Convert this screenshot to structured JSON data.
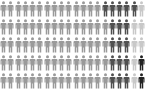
{
  "chart_data": {
    "type": "pictogram",
    "title": "",
    "grid": {
      "columns": 20,
      "rows": 5,
      "total_units": 100
    },
    "icon": "person-icon",
    "categories": [
      "gray",
      "dark",
      "light",
      "black"
    ],
    "colors": {
      "gray": "#9a9a9a",
      "dark": "#505050",
      "light": "#c8c8c8",
      "black": "#222222"
    },
    "values": [
      74,
      17,
      7,
      2
    ],
    "rows": [
      [
        "gray",
        "gray",
        "gray",
        "gray",
        "gray",
        "gray",
        "gray",
        "gray",
        "gray",
        "gray",
        "gray",
        "gray",
        "gray",
        "gray",
        "dark",
        "dark",
        "dark",
        "dark",
        "dark",
        "light"
      ],
      [
        "gray",
        "gray",
        "gray",
        "gray",
        "gray",
        "gray",
        "gray",
        "gray",
        "gray",
        "gray",
        "gray",
        "gray",
        "gray",
        "gray",
        "gray",
        "dark",
        "dark",
        "dark",
        "light",
        "light"
      ],
      [
        "gray",
        "gray",
        "gray",
        "gray",
        "gray",
        "gray",
        "gray",
        "gray",
        "gray",
        "gray",
        "gray",
        "gray",
        "gray",
        "gray",
        "gray",
        "dark",
        "dark",
        "dark",
        "light",
        "light"
      ],
      [
        "gray",
        "gray",
        "gray",
        "gray",
        "gray",
        "gray",
        "gray",
        "gray",
        "gray",
        "gray",
        "gray",
        "gray",
        "gray",
        "gray",
        "gray",
        "dark",
        "dark",
        "dark",
        "light",
        "black"
      ],
      [
        "gray",
        "gray",
        "gray",
        "gray",
        "gray",
        "gray",
        "gray",
        "gray",
        "gray",
        "gray",
        "gray",
        "gray",
        "gray",
        "gray",
        "gray",
        "dark",
        "dark",
        "dark",
        "light",
        "black"
      ]
    ]
  }
}
